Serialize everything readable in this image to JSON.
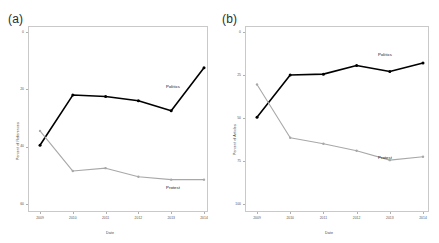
{
  "figure": {
    "panels": [
      {
        "letter": "(a)",
        "ylabel": "Percent of References",
        "xlabel": "Date",
        "yticks": [
          "60",
          "40",
          "20",
          "0"
        ],
        "xticks": [
          "2009",
          "2010",
          "2011",
          "2012",
          "2013",
          "2014"
        ],
        "series_labels": {
          "politics": "Politics",
          "protest": "Protest"
        }
      },
      {
        "letter": "(b)",
        "ylabel": "Percent of Articles",
        "xlabel": "Date",
        "yticks": [
          "100",
          "75",
          "50",
          "25",
          "0"
        ],
        "xticks": [
          "2009",
          "2010",
          "2011",
          "2012",
          "2013",
          "2014"
        ],
        "series_labels": {
          "politics": "Politics",
          "protest": "Protest"
        }
      }
    ],
    "colors": {
      "politics": "#000000",
      "protest": "#a8a8a8",
      "axis": "#c9c9c9",
      "text": "#444444"
    },
    "caption": ""
  },
  "chart_data": [
    {
      "type": "line",
      "title": "(a)",
      "xlabel": "Date",
      "ylabel": "Percent of References",
      "x": [
        2009,
        2010,
        2011,
        2012,
        2013,
        2014
      ],
      "xlim": [
        2009,
        2014
      ],
      "ylim": [
        0,
        60
      ],
      "yticks": [
        0,
        20,
        40,
        60
      ],
      "grid": false,
      "legend": "inline-labels",
      "series": [
        {
          "name": "Politics",
          "color": "#000000",
          "values": [
            20.5,
            38.0,
            37.5,
            36.0,
            32.5,
            47.5
          ]
        },
        {
          "name": "Protest",
          "color": "#a8a8a8",
          "values": [
            25.5,
            11.5,
            12.5,
            9.5,
            8.5,
            8.5
          ]
        }
      ]
    },
    {
      "type": "line",
      "title": "(b)",
      "xlabel": "Date",
      "ylabel": "Percent of Articles",
      "x": [
        2009,
        2010,
        2011,
        2012,
        2013,
        2014
      ],
      "xlim": [
        2009,
        2014
      ],
      "ylim": [
        0,
        100
      ],
      "yticks": [
        0,
        25,
        50,
        75,
        100
      ],
      "grid": false,
      "legend": "inline-labels",
      "series": [
        {
          "name": "Politics",
          "color": "#000000",
          "values": [
            50.5,
            75.0,
            75.5,
            80.5,
            77.0,
            82.0
          ]
        },
        {
          "name": "Protest",
          "color": "#a8a8a8",
          "values": [
            69.5,
            38.5,
            35.0,
            31.0,
            25.5,
            27.5
          ]
        }
      ]
    }
  ]
}
